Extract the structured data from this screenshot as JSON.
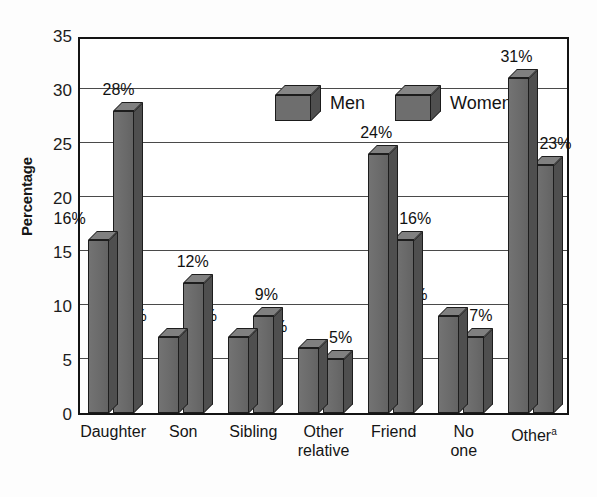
{
  "chart_data": {
    "type": "bar",
    "title": "",
    "subtitle": "",
    "xlabel": "",
    "ylabel": "Percentage",
    "ylim": [
      0,
      35
    ],
    "ytick_step": 5,
    "yticks": [
      "35",
      "30",
      "25",
      "20",
      "15",
      "10",
      "5",
      "0"
    ],
    "grid": "horizontal",
    "legend_position": "top-center",
    "categories": [
      "Daughter",
      "Son",
      "Sibling",
      "Other relative",
      "Friend",
      "No one",
      "Other"
    ],
    "category_lines": [
      [
        "Daughter",
        ""
      ],
      [
        "Son",
        ""
      ],
      [
        "Sibling",
        ""
      ],
      [
        "Other",
        "relative"
      ],
      [
        "Friend",
        ""
      ],
      [
        "No",
        "one"
      ],
      [
        "Other",
        ""
      ]
    ],
    "category_footnote_marker": "a",
    "series": [
      {
        "name": "Men",
        "values": [
          16,
          7,
          7,
          6,
          24,
          9,
          31
        ],
        "labels": [
          "16%",
          "7%",
          "7%",
          "6%",
          "24%",
          "9%",
          "31%"
        ],
        "color": "#6e6e6e"
      },
      {
        "name": "Women",
        "values": [
          28,
          12,
          9,
          5,
          16,
          7,
          23
        ],
        "labels": [
          "28%",
          "12%",
          "9%",
          "5%",
          "16%",
          "7%",
          "23%"
        ],
        "color": "#6e6e6e"
      }
    ]
  },
  "legend": {
    "entries": [
      {
        "label": "Men",
        "icon": "cube-3d-icon"
      },
      {
        "label": "Women",
        "icon": "cube-3d-icon"
      }
    ]
  },
  "colors": {
    "bar_front": "#6e6e6e",
    "bar_top": "#808080",
    "bar_side": "#4f4f4f",
    "outline": "#1d1d1d",
    "gridline": "#4a4a4a",
    "text": "#141414",
    "background": "#ffffff"
  }
}
